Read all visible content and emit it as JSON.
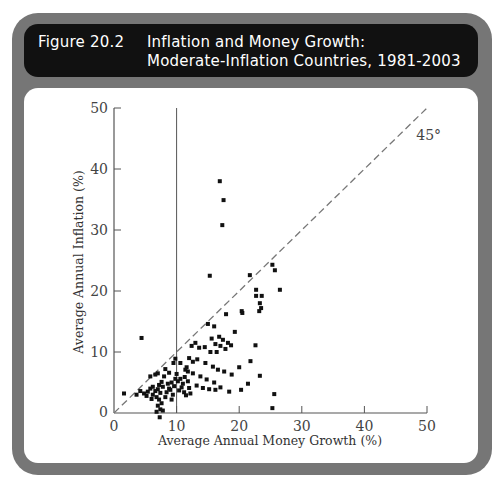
{
  "figure": {
    "number": "Figure 20.2",
    "title_line1": "Inflation and Money Growth:",
    "title_line2": "Moderate-Inflation Countries, 1981-2003"
  },
  "colors": {
    "frame": "#767676",
    "header_bg": "#111111",
    "header_text": "#ffffff",
    "points": "#111111",
    "reference_line": "#777777"
  },
  "chart_data": {
    "type": "scatter",
    "title": "Inflation and Money Growth: Moderate-Inflation Countries, 1981-2003",
    "xlabel": "Average Annual Money Growth (%)",
    "ylabel": "Average Annual Inflation (%)",
    "xlim": [
      0,
      50
    ],
    "ylim": [
      0,
      50
    ],
    "xticks": [
      0,
      10,
      20,
      30,
      40,
      50
    ],
    "yticks": [
      0,
      10,
      20,
      30,
      40,
      50
    ],
    "grid": false,
    "annotations": [
      {
        "type": "line",
        "style": "dashed",
        "label": "45°",
        "from": [
          0,
          0
        ],
        "to": [
          50,
          50
        ]
      },
      {
        "type": "vline",
        "style": "solid",
        "x": 10
      }
    ],
    "points": [
      [
        16.9,
        38.0
      ],
      [
        17.5,
        34.9
      ],
      [
        17.3,
        30.8
      ],
      [
        15.3,
        22.5
      ],
      [
        21.7,
        22.6
      ],
      [
        25.3,
        24.3
      ],
      [
        25.7,
        23.4
      ],
      [
        22.7,
        20.2
      ],
      [
        22.7,
        19.2
      ],
      [
        23.6,
        19.2
      ],
      [
        23.3,
        18.0
      ],
      [
        26.5,
        20.2
      ],
      [
        17.9,
        16.2
      ],
      [
        20.4,
        16.7
      ],
      [
        20.5,
        16.4
      ],
      [
        23.2,
        16.7
      ],
      [
        23.5,
        17.2
      ],
      [
        19.3,
        13.3
      ],
      [
        18.7,
        11.1
      ],
      [
        22.6,
        11.1
      ],
      [
        21.8,
        8.5
      ],
      [
        20.0,
        7.5
      ],
      [
        23.3,
        6.1
      ],
      [
        21.4,
        4.8
      ],
      [
        20.3,
        3.8
      ],
      [
        25.6,
        3.1
      ],
      [
        25.3,
        0.8
      ],
      [
        15.0,
        14.6
      ],
      [
        16.0,
        14.2
      ],
      [
        16.8,
        12.5
      ],
      [
        17.4,
        12.0
      ],
      [
        15.6,
        12.2
      ],
      [
        16.2,
        11.3
      ],
      [
        17.0,
        11.0
      ],
      [
        14.5,
        10.8
      ],
      [
        15.4,
        10.0
      ],
      [
        16.4,
        10.0
      ],
      [
        18.2,
        11.5
      ],
      [
        17.8,
        10.5
      ],
      [
        13.0,
        11.5
      ],
      [
        13.6,
        10.7
      ],
      [
        12.4,
        11.0
      ],
      [
        12.0,
        9.0
      ],
      [
        13.3,
        8.8
      ],
      [
        14.6,
        8.2
      ],
      [
        15.8,
        7.6
      ],
      [
        16.6,
        7.1
      ],
      [
        17.6,
        6.8
      ],
      [
        18.8,
        6.3
      ],
      [
        11.6,
        7.5
      ],
      [
        12.6,
        6.5
      ],
      [
        13.8,
        6.0
      ],
      [
        14.8,
        5.5
      ],
      [
        16.0,
        5.0
      ],
      [
        17.0,
        4.2
      ],
      [
        16.2,
        3.8
      ],
      [
        15.2,
        3.9
      ],
      [
        13.2,
        4.5
      ],
      [
        14.2,
        4.1
      ],
      [
        18.4,
        3.5
      ],
      [
        10.2,
        5.2
      ],
      [
        10.6,
        5.6
      ],
      [
        11.0,
        4.8
      ],
      [
        11.3,
        5.9
      ],
      [
        11.8,
        5.2
      ],
      [
        10.8,
        4.2
      ],
      [
        11.2,
        3.4
      ],
      [
        11.5,
        2.9
      ],
      [
        12.2,
        3.2
      ],
      [
        10.4,
        3.7
      ],
      [
        12.0,
        4.1
      ],
      [
        10.0,
        6.4
      ],
      [
        11.8,
        6.8
      ],
      [
        9.5,
        8.2
      ],
      [
        9.8,
        5.6
      ],
      [
        9.2,
        5.0
      ],
      [
        9.6,
        4.4
      ],
      [
        9.0,
        3.8
      ],
      [
        9.4,
        3.0
      ],
      [
        8.6,
        4.8
      ],
      [
        8.8,
        4.0
      ],
      [
        8.4,
        3.4
      ],
      [
        8.2,
        2.6
      ],
      [
        9.2,
        2.2
      ],
      [
        8.0,
        6.0
      ],
      [
        7.6,
        5.1
      ],
      [
        7.2,
        4.6
      ],
      [
        7.8,
        4.3
      ],
      [
        7.0,
        3.9
      ],
      [
        7.4,
        3.3
      ],
      [
        6.6,
        3.6
      ],
      [
        6.2,
        3.0
      ],
      [
        6.8,
        2.6
      ],
      [
        7.2,
        2.2
      ],
      [
        7.6,
        1.6
      ],
      [
        7.0,
        1.2
      ],
      [
        7.4,
        0.6
      ],
      [
        7.8,
        0.4
      ],
      [
        6.8,
        0.2
      ],
      [
        7.3,
        -0.7
      ],
      [
        5.8,
        4.0
      ],
      [
        6.2,
        4.3
      ],
      [
        5.4,
        3.5
      ],
      [
        6.0,
        2.3
      ],
      [
        5.2,
        2.8
      ],
      [
        4.8,
        3.2
      ],
      [
        6.6,
        6.3
      ],
      [
        5.8,
        6.0
      ],
      [
        7.0,
        6.5
      ],
      [
        4.4,
        12.3
      ],
      [
        4.2,
        3.6
      ],
      [
        3.6,
        3.0
      ],
      [
        1.6,
        3.2
      ],
      [
        8.2,
        7.2
      ],
      [
        8.8,
        6.6
      ],
      [
        9.8,
        8.9
      ],
      [
        10.6,
        8.2
      ],
      [
        12.6,
        8.4
      ],
      [
        11.4,
        7.1
      ]
    ]
  }
}
